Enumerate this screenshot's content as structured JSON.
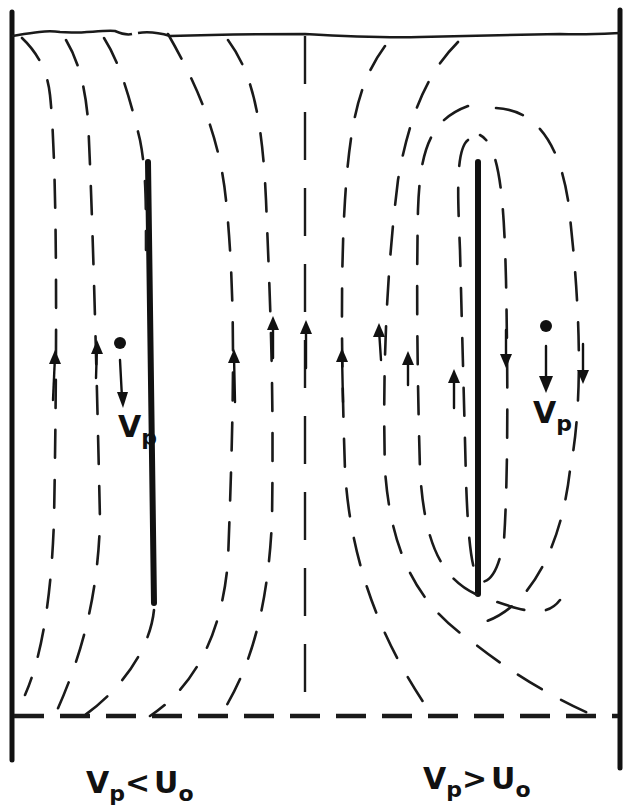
{
  "figure": {
    "labels": {
      "left_particle_velocity": {
        "main": "V",
        "sub": "p"
      },
      "right_particle_velocity": {
        "main": "V",
        "sub": "p"
      },
      "left_condition": {
        "v": "V",
        "v_sub": "p",
        "op": "<",
        "u": "U",
        "u_sub": "o"
      },
      "right_condition": {
        "v": "V",
        "v_sub": "p",
        "op": ">",
        "u": "U",
        "u_sub": "o"
      }
    },
    "colors": {
      "ink": "#111111",
      "background": "#ffffff"
    }
  }
}
